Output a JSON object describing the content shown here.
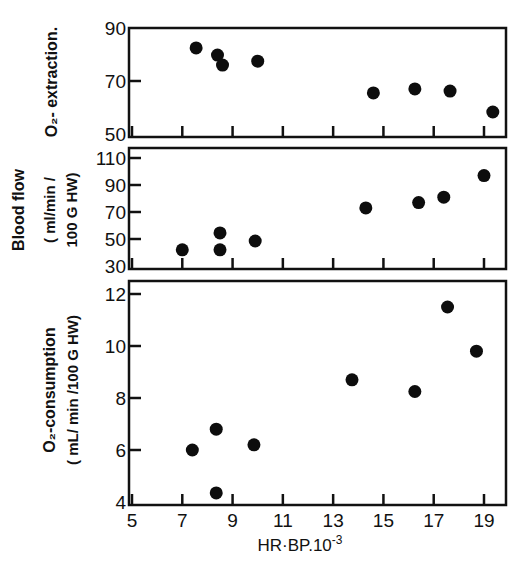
{
  "figure": {
    "xlabel": "HR·BP.10",
    "xlabel_exp": "-3",
    "x_ticks": [
      "5",
      "7",
      "9",
      "11",
      "13",
      "15",
      "17",
      "19"
    ],
    "x_tick_values": [
      5,
      7,
      9,
      11,
      13,
      15,
      17,
      19
    ]
  },
  "panels": [
    {
      "title_line1": "O₂- extraction.",
      "title_line2": "",
      "y_ticks": [
        "90",
        "70",
        "50"
      ],
      "y_tick_values": [
        90,
        70,
        50
      ]
    },
    {
      "title_line1": "Blood flow",
      "title_line2": "( ml/min /",
      "title_line3": "100 G HW)",
      "y_ticks": [
        "110",
        "90",
        "70",
        "50",
        "30"
      ],
      "y_tick_values": [
        110,
        90,
        70,
        50,
        30
      ]
    },
    {
      "title_line1": "O₂-consumption",
      "title_line2": "( mL/ min /100 G HW)",
      "y_ticks": [
        "12",
        "10",
        "8",
        "6",
        "4"
      ],
      "y_tick_values": [
        12,
        10,
        8,
        6,
        4
      ]
    }
  ],
  "chart_data": [
    {
      "type": "scatter",
      "title": "",
      "xlabel": "HR·BP.10^-3",
      "ylabel": "O2- extraction.",
      "xlim": [
        4.8,
        19.9
      ],
      "ylim": [
        50,
        90
      ],
      "y_ticks": [
        50,
        70,
        90
      ],
      "grid": false,
      "x": [
        7.55,
        8.4,
        8.6,
        10.0,
        14.6,
        16.25,
        17.65,
        19.35
      ],
      "y": [
        82.5,
        79.8,
        76.0,
        77.5,
        65.5,
        67.0,
        66.2,
        58.3
      ]
    },
    {
      "type": "scatter",
      "title": "",
      "xlabel": "HR·BP.10^-3",
      "ylabel": "Blood flow (ml/min / 100 G HW)",
      "xlim": [
        4.8,
        19.9
      ],
      "ylim": [
        30,
        118
      ],
      "y_ticks": [
        30,
        50,
        70,
        90,
        110
      ],
      "grid": false,
      "x": [
        7.0,
        8.5,
        8.5,
        9.9,
        14.3,
        16.4,
        17.4,
        19.0
      ],
      "y": [
        42,
        54.5,
        42,
        48.5,
        73,
        77,
        81,
        97
      ]
    },
    {
      "type": "scatter",
      "title": "",
      "xlabel": "HR·BP.10^-3",
      "ylabel": "O2-consumption (mL/min /100 G HW)",
      "xlim": [
        4.8,
        19.9
      ],
      "ylim": [
        4,
        12.6
      ],
      "y_ticks": [
        4,
        6,
        8,
        10,
        12
      ],
      "grid": false,
      "x": [
        7.4,
        8.35,
        8.35,
        9.85,
        13.75,
        16.25,
        17.55,
        18.7
      ],
      "y": [
        6.0,
        6.8,
        4.35,
        6.2,
        8.7,
        8.25,
        11.5,
        9.8
      ]
    }
  ]
}
